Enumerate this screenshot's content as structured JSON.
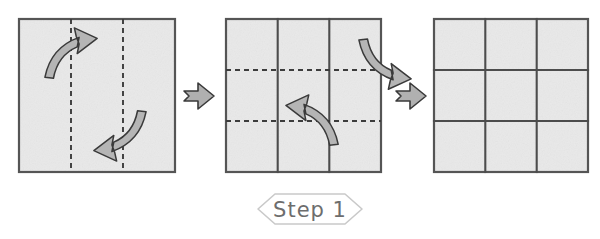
{
  "diagram": {
    "background_color": "#ffffff",
    "paper_color": "#e9e9e9",
    "border_color": "#555555",
    "crease_color": "#4c4c4c",
    "fold_line_color": "#3c3c3c",
    "arrow_fill_color": "#b5b5b5",
    "arrow_stroke_color": "#3a3a3a",
    "badge_outline_color": "#c9c9c9",
    "badge_text_color": "#6d6d6d"
  },
  "step_badge": {
    "label": "Step 1",
    "shape": "hexagon"
  },
  "panels": [
    {
      "index": 1,
      "name": "panel-initial-square",
      "description": "Plain square sheet with two vertical dashed fold lines marking vertical thirds",
      "x": 19,
      "y": 19,
      "width": 156,
      "height": 153,
      "solid_creases": [],
      "dashed_folds": [
        {
          "orientation": "vertical",
          "position_fraction": 0.3333
        },
        {
          "orientation": "vertical",
          "position_fraction": 0.6667
        }
      ],
      "arrows": [
        {
          "name": "fold-arrow-up-right",
          "direction": "up-right",
          "description": "Curved arrow sweeping from lower-left upward to the right"
        },
        {
          "name": "fold-arrow-down-left",
          "direction": "down-left",
          "description": "Curved arrow sweeping from upper-right downward to the left"
        }
      ]
    },
    {
      "index": 2,
      "name": "panel-vertical-thirds-creased",
      "description": "Sheet with two vertical creases made, now showing two horizontal dashed fold lines",
      "x": 226,
      "y": 19,
      "width": 155,
      "height": 153,
      "solid_creases": [
        {
          "orientation": "vertical",
          "position_fraction": 0.3333
        },
        {
          "orientation": "vertical",
          "position_fraction": 0.6667
        }
      ],
      "dashed_folds": [
        {
          "orientation": "horizontal",
          "position_fraction": 0.3333
        },
        {
          "orientation": "horizontal",
          "position_fraction": 0.6667
        }
      ],
      "arrows": [
        {
          "name": "fold-arrow-down-right",
          "direction": "down-right",
          "description": "Curved arrow sweeping from upper-left downward to the right"
        },
        {
          "name": "fold-arrow-up-left",
          "direction": "up-left",
          "description": "Curved arrow sweeping from lower-right upward to the left"
        }
      ]
    },
    {
      "index": 3,
      "name": "panel-completed-grid",
      "description": "Completed sheet showing a full three by three grid of creases",
      "x": 434,
      "y": 19,
      "width": 154,
      "height": 153,
      "solid_creases": [
        {
          "orientation": "vertical",
          "position_fraction": 0.3333
        },
        {
          "orientation": "vertical",
          "position_fraction": 0.6667
        },
        {
          "orientation": "horizontal",
          "position_fraction": 0.3333
        },
        {
          "orientation": "horizontal",
          "position_fraction": 0.6667
        }
      ],
      "dashed_folds": [],
      "arrows": []
    }
  ],
  "separators": [
    {
      "name": "separator-arrow-1",
      "symbol": "right-arrow",
      "x": 182,
      "y": 96,
      "after_panel": 1
    },
    {
      "name": "separator-arrow-2",
      "symbol": "right-arrow",
      "x": 394,
      "y": 96,
      "after_panel": 2
    }
  ]
}
